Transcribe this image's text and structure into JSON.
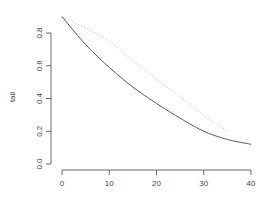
{
  "chart_data": {
    "type": "line",
    "title": "",
    "xlabel": "",
    "ylabel": "tail",
    "xlim": [
      0,
      40
    ],
    "ylim": [
      0,
      0.9
    ],
    "grid": false,
    "legend": null,
    "x_ticks": [
      "0",
      "10",
      "20",
      "30",
      "40"
    ],
    "y_ticks": [
      "0.0",
      "0.2",
      "0.4",
      "0.6",
      "0.8"
    ],
    "series": [
      {
        "name": "solid",
        "style": "solid",
        "color": "#555555",
        "x": [
          0,
          5,
          10,
          15,
          20,
          25,
          30,
          35,
          40
        ],
        "values": [
          0.9,
          0.73,
          0.59,
          0.47,
          0.37,
          0.28,
          0.2,
          0.15,
          0.12
        ]
      },
      {
        "name": "dotted",
        "style": "dotted",
        "color": "#bbbbbb",
        "x": [
          0,
          5,
          10,
          15,
          20,
          25,
          30,
          35
        ],
        "values": [
          0.9,
          0.83,
          0.75,
          0.63,
          0.52,
          0.41,
          0.3,
          0.2
        ]
      }
    ]
  }
}
